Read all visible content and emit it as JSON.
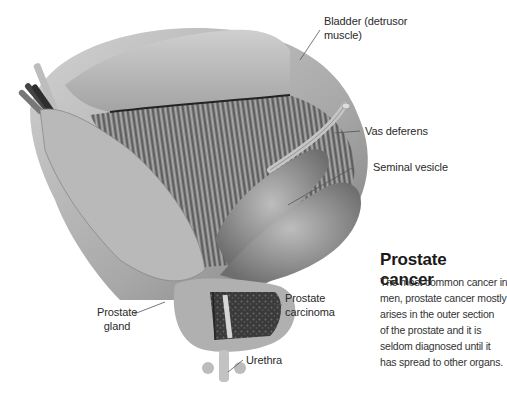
{
  "figure": {
    "title": "Prostate cancer",
    "description_lines": [
      "The most common cancer in",
      "men, prostate cancer mostly",
      "arises in the outer section",
      "of the prostate and it is",
      "seldom diagnosed until it",
      "has spread to other organs."
    ],
    "labels": {
      "bladder_line1": "Bladder (detrusor",
      "bladder_line2": "muscle)",
      "vas_deferens": "Vas deferens",
      "seminal_vesicle": "Seminal vesicle",
      "prostate_carcinoma_line1": "Prostate",
      "prostate_carcinoma_line2": "carcinoma",
      "prostate_gland_line1": "Prostate",
      "prostate_gland_line2": "gland",
      "urethra": "Urethra"
    },
    "colors": {
      "tissue_light": "#c9c9c9",
      "tissue_mid": "#9a9a9a",
      "tissue_dark": "#3a3a3a",
      "leader_line": "#555555"
    }
  }
}
